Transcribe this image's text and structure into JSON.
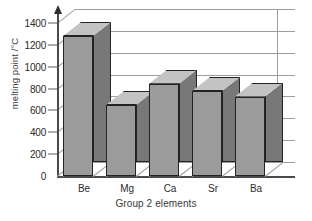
{
  "chart_data": {
    "type": "bar",
    "title": "",
    "categories": [
      "Be",
      "Mg",
      "Ca",
      "Sr",
      "Ba"
    ],
    "values": [
      1280,
      650,
      845,
      777,
      727
    ],
    "xlabel": "Group 2 elements",
    "ylabel": "melting point /°C",
    "ylim": [
      0,
      1400
    ],
    "ytick_step": 200,
    "yticks": [
      0,
      200,
      400,
      600,
      800,
      1000,
      1200,
      1400
    ],
    "ytick_labels": [
      "0",
      "200",
      "400",
      "600",
      "800",
      "1000",
      "1200",
      "1400"
    ],
    "grid": true,
    "grid_axis": "y",
    "legend": "none",
    "style": "3d-bar",
    "colors": {
      "bar_front": "#9b9b9b",
      "bar_top": "#c3c3c3",
      "bar_side": "#787878",
      "bar_outline": "#232323",
      "grid": "#9d9d9d",
      "axis": "#4a4a4a",
      "text": "#2b2b2b",
      "background": "#ffffff"
    }
  }
}
